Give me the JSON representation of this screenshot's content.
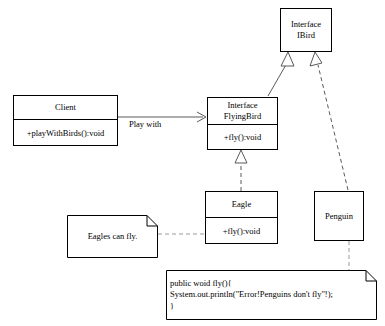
{
  "diagram": {
    "line_color": "#5a5a5a",
    "node_border_color": "#000000",
    "background": "#ffffff"
  },
  "nodes": {
    "ibird": {
      "name": "ibird-class-box",
      "stereotype": "Interface",
      "title": "IBird",
      "header": "Interface\nIBird"
    },
    "client": {
      "name": "client-class-box",
      "title": "Client",
      "operations": "+playWithBirds():void"
    },
    "flyingbird": {
      "name": "flyingbird-class-box",
      "stereotype": "Interface",
      "title": "FlyingBird",
      "header": "Interface\nFlyingBird",
      "operations": "+fly():void"
    },
    "eagle": {
      "name": "eagle-class-box",
      "title": "Eagle",
      "operations": "+fly():void"
    },
    "penguin": {
      "name": "penguin-class-box",
      "title": "Penguin"
    }
  },
  "notes": {
    "eagle_note": {
      "name": "eagle-note",
      "text": "Eagles can fly."
    },
    "penguin_note": {
      "name": "penguin-code-note",
      "text": "public woid fly(){\nSystem.out.println(\"Error!Penguins don't fly\"!);\n}"
    }
  },
  "edges": {
    "client_to_flyingbird": {
      "name": "association-client-flyingbird",
      "label": "Play with",
      "style": "solid",
      "arrow": "open-arrow"
    },
    "flyingbird_to_ibird": {
      "name": "generalization-flyingbird-ibird",
      "style": "solid",
      "arrow": "hollow-triangle"
    },
    "penguin_to_ibird": {
      "name": "realization-penguin-ibird",
      "style": "dashed",
      "arrow": "hollow-triangle"
    },
    "eagle_to_flyingbird": {
      "name": "realization-eagle-flyingbird",
      "style": "dashed",
      "arrow": "hollow-triangle"
    },
    "eagle_note_link": {
      "name": "note-link-eagle",
      "style": "dashed",
      "arrow": "none"
    },
    "penguin_note_link": {
      "name": "note-link-penguin",
      "style": "dashed",
      "arrow": "none"
    }
  }
}
